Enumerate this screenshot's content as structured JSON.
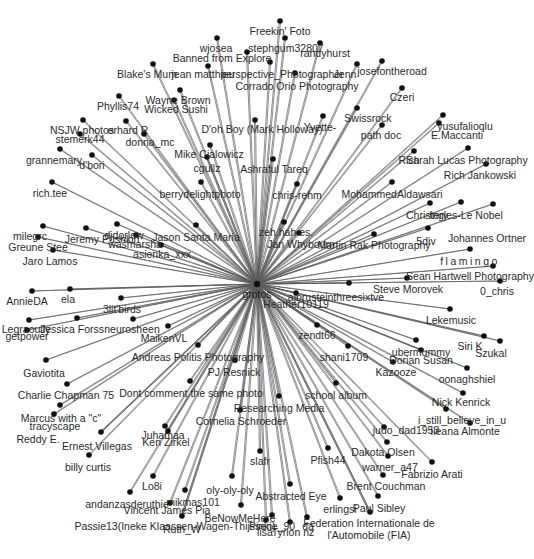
{
  "graph": {
    "title": "Flickr contact network",
    "center": {
      "id": "grotos",
      "label": "grotos",
      "x": 257,
      "y": 284,
      "lx": 257,
      "ly": 289
    },
    "colors": {
      "edge": "#5a5a5a",
      "node": "#111111",
      "label": "#2a2a2a",
      "background": "#ffffff"
    },
    "nodes": [
      {
        "label": "Freekin' Foto",
        "x": 280,
        "y": 21,
        "lx": 280,
        "ly": 26
      },
      {
        "label": "stephgum32807",
        "x": 285,
        "y": 38,
        "lx": 286,
        "ly": 43
      },
      {
        "label": "wjosea",
        "x": 217,
        "y": 38,
        "lx": 216,
        "ly": 43
      },
      {
        "label": "randyhurst",
        "x": 320,
        "y": 43,
        "lx": 325,
        "ly": 48
      },
      {
        "label": "Banned from Explore",
        "x": 247,
        "y": 52,
        "lx": 222,
        "ly": 53
      },
      {
        "label": "jean matthieu",
        "x": 208,
        "y": 66,
        "lx": 203,
        "ly": 69
      },
      {
        "label": "Blake's Mum",
        "x": 153,
        "y": 64,
        "lx": 147,
        "ly": 69
      },
      {
        "label": "perspective_Photographer",
        "x": 270,
        "y": 62,
        "lx": 282,
        "ly": 69
      },
      {
        "label": "Corrado Orio Photography",
        "x": 295,
        "y": 73,
        "lx": 297,
        "ly": 81
      },
      {
        "label": "Jenn",
        "x": 357,
        "y": 64,
        "lx": 345,
        "ly": 69
      },
      {
        "label": "josefontheroad",
        "x": 382,
        "y": 61,
        "lx": 392,
        "ly": 66
      },
      {
        "label": "Wayne Brown",
        "x": 180,
        "y": 90,
        "lx": 178,
        "ly": 95
      },
      {
        "label": "Wicked Sushi",
        "x": 174,
        "y": 100,
        "lx": 176,
        "ly": 104
      },
      {
        "label": "Phyllis74",
        "x": 119,
        "y": 96,
        "lx": 118,
        "ly": 101
      },
      {
        "label": "Czeri",
        "x": 402,
        "y": 88,
        "lx": 402,
        "ly": 92
      },
      {
        "label": "D'oh Boy (Mark Holloway)",
        "x": 255,
        "y": 120,
        "lx": 262,
        "ly": 124
      },
      {
        "label": "Yvette-",
        "x": 323,
        "y": 116,
        "lx": 320,
        "ly": 122
      },
      {
        "label": "Swissrock",
        "x": 357,
        "y": 108,
        "lx": 368,
        "ly": 113
      },
      {
        "label": "NSJW photos",
        "x": 83,
        "y": 120,
        "lx": 82,
        "ly": 125
      },
      {
        "label": "erhard R",
        "x": 126,
        "y": 121,
        "lx": 128,
        "ly": 125
      },
      {
        "label": "stemerk44",
        "x": 80,
        "y": 134,
        "lx": 80,
        "ly": 134
      },
      {
        "label": "donna_mc",
        "x": 144,
        "y": 134,
        "lx": 150,
        "ly": 137
      },
      {
        "label": "path doc",
        "x": 382,
        "y": 125,
        "lx": 381,
        "ly": 130
      },
      {
        "label": "yusufalioqlu",
        "x": 443,
        "y": 115,
        "lx": 465,
        "ly": 121
      },
      {
        "label": "E.Maccanti",
        "x": 439,
        "y": 123,
        "lx": 457,
        "ly": 130
      },
      {
        "label": "Mike Cialowicz",
        "x": 210,
        "y": 145,
        "lx": 209,
        "ly": 149
      },
      {
        "label": "grannemary",
        "x": 60,
        "y": 149,
        "lx": 54,
        "ly": 155
      },
      {
        "label": "d'bori",
        "x": 92,
        "y": 155,
        "lx": 92,
        "ly": 160
      },
      {
        "label": "cgullz",
        "x": 207,
        "y": 157,
        "lx": 207,
        "ly": 163
      },
      {
        "label": "Ashraful Tareq",
        "x": 273,
        "y": 159,
        "lx": 274,
        "ly": 164
      },
      {
        "label": "Rich",
        "x": 414,
        "y": 151,
        "lx": 409,
        "ly": 155
      },
      {
        "label": "Sarah Lucas Photography",
        "x": 468,
        "y": 148,
        "lx": 467,
        "ly": 155
      },
      {
        "label": "Rich Jankowski",
        "x": 486,
        "y": 164,
        "lx": 480,
        "ly": 170
      },
      {
        "label": "rich.tee",
        "x": 52,
        "y": 182,
        "lx": 50,
        "ly": 188
      },
      {
        "label": "berrydelightphoto",
        "x": 201,
        "y": 182,
        "lx": 200,
        "ly": 189
      },
      {
        "label": "chris-rehm",
        "x": 297,
        "y": 184,
        "lx": 297,
        "ly": 190
      },
      {
        "label": "MohammedAldawsari",
        "x": 392,
        "y": 182,
        "lx": 392,
        "ly": 189
      },
      {
        "label": "Christery",
        "x": 430,
        "y": 203,
        "lx": 427,
        "ly": 210
      },
      {
        "label": "Ingles-Le Nobel",
        "x": 461,
        "y": 202,
        "lx": 466,
        "ly": 210
      },
      {
        "label": "Johannes Ortner",
        "x": 493,
        "y": 204,
        "lx": 487,
        "ly": 233
      },
      {
        "label": "milegrc",
        "x": 43,
        "y": 226,
        "lx": 30,
        "ly": 231
      },
      {
        "label": "Jeremy Pushkin",
        "x": 86,
        "y": 228,
        "lx": 102,
        "ly": 234
      },
      {
        "label": "djdorlow",
        "x": 117,
        "y": 224,
        "lx": 124,
        "ly": 230
      },
      {
        "label": "wasmarsha",
        "x": 136,
        "y": 235,
        "lx": 135,
        "ly": 239
      },
      {
        "label": "Jason Santa Maria",
        "x": 196,
        "y": 225,
        "lx": 196,
        "ly": 232
      },
      {
        "label": "zeh.hah es.",
        "x": 284,
        "y": 222,
        "lx": 286,
        "ly": 227
      },
      {
        "label": "Jan Whybourn",
        "x": 299,
        "y": 233,
        "lx": 301,
        "ly": 239
      },
      {
        "label": "Martin Rak Photography",
        "x": 374,
        "y": 234,
        "lx": 374,
        "ly": 240
      },
      {
        "label": "5div",
        "x": 428,
        "y": 228,
        "lx": 426,
        "ly": 236
      },
      {
        "label": "Greune Stee",
        "x": 38,
        "y": 237,
        "lx": 38,
        "ly": 242
      },
      {
        "label": "asienka_xxx",
        "x": 161,
        "y": 245,
        "lx": 162,
        "ly": 249
      },
      {
        "label": "Jaro Lamos",
        "x": 53,
        "y": 250,
        "lx": 50,
        "ly": 256
      },
      {
        "label": "flamingo",
        "x": 470,
        "y": 249,
        "lx": 470,
        "ly": 256,
        "spaced": true
      },
      {
        "label": "Sean Hartwell Photography",
        "x": 493,
        "y": 266,
        "lx": 470,
        "ly": 271
      },
      {
        "label": "Steve Morovek",
        "x": 407,
        "y": 278,
        "lx": 408,
        "ly": 284
      },
      {
        "label": "0_chris",
        "x": 500,
        "y": 281,
        "lx": 497,
        "ly": 286
      },
      {
        "label": "ajbrusteinthreesixtve",
        "x": 349,
        "y": 283,
        "lx": 336,
        "ly": 292
      },
      {
        "label": "Heather10119",
        "x": 296,
        "y": 293,
        "lx": 296,
        "ly": 299
      },
      {
        "label": "AnnieDA",
        "x": 32,
        "y": 291,
        "lx": 27,
        "ly": 296
      },
      {
        "label": "ela",
        "x": 70,
        "y": 289,
        "lx": 68,
        "ly": 294
      },
      {
        "label": "3lit'birds",
        "x": 121,
        "y": 298,
        "lx": 122,
        "ly": 304
      },
      {
        "label": "Lekemusic",
        "x": 450,
        "y": 309,
        "lx": 451,
        "ly": 315
      },
      {
        "label": "Legraoully",
        "x": 29,
        "y": 320,
        "lx": 26,
        "ly": 324
      },
      {
        "label": "getpower",
        "x": 27,
        "y": 330,
        "lx": 27,
        "ly": 331
      },
      {
        "label": "Jessica Forss",
        "x": 77,
        "y": 318,
        "lx": 72,
        "ly": 324
      },
      {
        "label": "neurosheen",
        "x": 133,
        "y": 319,
        "lx": 132,
        "ly": 324
      },
      {
        "label": "MaikenVL",
        "x": 168,
        "y": 326,
        "lx": 164,
        "ly": 333
      },
      {
        "label": "zendt66",
        "x": 317,
        "y": 325,
        "lx": 317,
        "ly": 330
      },
      {
        "label": "Siri K",
        "x": 484,
        "y": 336,
        "lx": 470,
        "ly": 341
      },
      {
        "label": "Szukal",
        "x": 500,
        "y": 341,
        "lx": 491,
        "ly": 348
      },
      {
        "label": "ubermummy",
        "x": 416,
        "y": 340,
        "lx": 421,
        "ly": 347
      },
      {
        "label": "shani1709",
        "x": 348,
        "y": 346,
        "lx": 344,
        "ly": 352
      },
      {
        "label": "Dorian Susan",
        "x": 421,
        "y": 350,
        "lx": 421,
        "ly": 355
      },
      {
        "label": "Andreas Politis Photography",
        "x": 198,
        "y": 345,
        "lx": 198,
        "ly": 352
      },
      {
        "label": "Kazooze",
        "x": 393,
        "y": 362,
        "lx": 396,
        "ly": 367
      },
      {
        "label": "oonaghshiel",
        "x": 467,
        "y": 368,
        "lx": 467,
        "ly": 374
      },
      {
        "label": "Gaviotita",
        "x": 46,
        "y": 360,
        "lx": 44,
        "ly": 368
      },
      {
        "label": "PJ Resnick",
        "x": 235,
        "y": 360,
        "lx": 234,
        "ly": 367
      },
      {
        "label": "Charlie Chapman 75",
        "x": 67,
        "y": 384,
        "lx": 66,
        "ly": 390
      },
      {
        "label": "Dont comment the same photo",
        "x": 190,
        "y": 381,
        "lx": 191,
        "ly": 388
      },
      {
        "label": "school album",
        "x": 336,
        "y": 383,
        "lx": 336,
        "ly": 390
      },
      {
        "label": "Nick Kenrick",
        "x": 463,
        "y": 393,
        "lx": 461,
        "ly": 397
      },
      {
        "label": "Marcus with a \"c\"",
        "x": 60,
        "y": 405,
        "lx": 61,
        "ly": 413
      },
      {
        "label": "tracyscape",
        "x": 54,
        "y": 414,
        "lx": 55,
        "ly": 421
      },
      {
        "label": "Researching Media",
        "x": 279,
        "y": 396,
        "lx": 279,
        "ly": 403
      },
      {
        "label": "i_still_believe_in_u",
        "x": 446,
        "y": 409,
        "lx": 462,
        "ly": 415
      },
      {
        "label": "Cornelia Schroeder",
        "x": 240,
        "y": 410,
        "lx": 241,
        "ly": 416
      },
      {
        "label": "judo_dad1953",
        "x": 384,
        "y": 427,
        "lx": 406,
        "ly": 425
      },
      {
        "label": "Ileana Almonte",
        "x": 470,
        "y": 423,
        "lx": 465,
        "ly": 426
      },
      {
        "label": "Reddy E.",
        "x": 101,
        "y": 432,
        "lx": 38,
        "ly": 434
      },
      {
        "label": "Ernest Villegas",
        "x": 101,
        "y": 432,
        "lx": 97,
        "ly": 441
      },
      {
        "label": "Juhamaa",
        "x": 165,
        "y": 426,
        "lx": 163,
        "ly": 430
      },
      {
        "label": "Ken Zirkel",
        "x": 168,
        "y": 431,
        "lx": 166,
        "ly": 437
      },
      {
        "label": "Dakota Olsen",
        "x": 387,
        "y": 442,
        "lx": 383,
        "ly": 447
      },
      {
        "label": "slafr",
        "x": 260,
        "y": 451,
        "lx": 260,
        "ly": 456
      },
      {
        "label": "billy curtis",
        "x": 89,
        "y": 455,
        "lx": 88,
        "ly": 462
      },
      {
        "label": "Pfish44",
        "x": 328,
        "y": 448,
        "lx": 328,
        "ly": 455
      },
      {
        "label": "warner_a47",
        "x": 388,
        "y": 456,
        "lx": 390,
        "ly": 462
      },
      {
        "label": "Fabrizio Arati",
        "x": 432,
        "y": 462,
        "lx": 432,
        "ly": 469
      },
      {
        "label": "Lo8i",
        "x": 153,
        "y": 476,
        "lx": 152,
        "ly": 481
      },
      {
        "label": "oly-oly-oly",
        "x": 232,
        "y": 476,
        "lx": 230,
        "ly": 485
      },
      {
        "label": "Brent Couchman",
        "x": 383,
        "y": 475,
        "lx": 386,
        "ly": 481
      },
      {
        "label": "Abstracted Eye",
        "x": 290,
        "y": 484,
        "lx": 291,
        "ly": 491
      },
      {
        "label": "andanzasderuthie",
        "x": 130,
        "y": 492,
        "lx": 127,
        "ly": 499
      },
      {
        "label": "mikmas101",
        "x": 185,
        "y": 490,
        "lx": 193,
        "ly": 497
      },
      {
        "label": "Vincent James Pia",
        "x": 170,
        "y": 503,
        "lx": 167,
        "ly": 505
      },
      {
        "label": "erlingsi",
        "x": 340,
        "y": 498,
        "lx": 340,
        "ly": 504
      },
      {
        "label": "Paul Sibley",
        "x": 378,
        "y": 496,
        "lx": 379,
        "ly": 503
      },
      {
        "label": "BeNowMeHere",
        "x": 241,
        "y": 505,
        "lx": 240,
        "ly": 513
      },
      {
        "label": "Passie13(Ineke Klaassen-Wagen-Thijssen)",
        "x": 182,
        "y": 516,
        "lx": 175,
        "ly": 521
      },
      {
        "label": "Ruth_W",
        "x": 182,
        "y": 516,
        "lx": 182,
        "ly": 524
      },
      {
        "label": "Pinkie_90",
        "x": 272,
        "y": 515,
        "lx": 272,
        "ly": 521
      },
      {
        "label": "lisa",
        "x": 266,
        "y": 520,
        "lx": 265,
        "ly": 527
      },
      {
        "label": "Tyrion nz",
        "x": 290,
        "y": 522,
        "lx": 293,
        "ly": 527
      },
      {
        "label": "da",
        "x": 307,
        "y": 517,
        "lx": 308,
        "ly": 521
      },
      {
        "label": "Federation Internationale de",
        "x": 370,
        "y": 512,
        "lx": 369,
        "ly": 518
      },
      {
        "label": "l'Automobile (FIA)",
        "x": 370,
        "y": 512,
        "lx": 369,
        "ly": 530
      }
    ]
  }
}
